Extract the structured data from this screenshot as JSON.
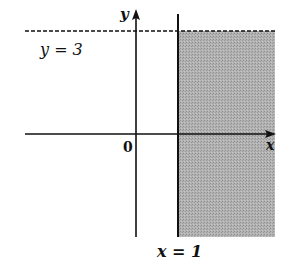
{
  "diagram": {
    "type": "coordinate-plane-inequality-region",
    "axes": {
      "x_label": "x",
      "y_label": "y",
      "origin_label": "0"
    },
    "lines": [
      {
        "name": "y-boundary",
        "equation_label": "y = 3",
        "style": "dashed",
        "orientation": "horizontal"
      },
      {
        "name": "x-boundary",
        "equation_label": "x = 1",
        "style": "solid",
        "orientation": "vertical"
      }
    ],
    "shaded_region": {
      "description": "x >= 1 and y < 3",
      "color": "#a9a9a9"
    },
    "colors": {
      "line": "#111111",
      "shade": "#a9a9a9",
      "background": "#ffffff"
    }
  }
}
